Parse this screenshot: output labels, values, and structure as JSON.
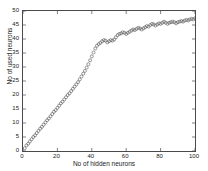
{
  "chart_data": {
    "type": "scatter",
    "title": "",
    "xlabel": "No of hidden neurons",
    "ylabel": "No of used neurons",
    "xlim": [
      0,
      100
    ],
    "ylim": [
      0,
      50
    ],
    "xticks": [
      0,
      20,
      40,
      60,
      80,
      100
    ],
    "yticks": [
      0,
      5,
      10,
      15,
      20,
      25,
      30,
      35,
      40,
      45,
      50
    ],
    "grid": false,
    "legend": null,
    "marker": "open-circle",
    "marker_color": "#555555",
    "series": [
      {
        "name": "used neurons",
        "x": [
          1,
          2,
          3,
          4,
          5,
          6,
          7,
          8,
          9,
          10,
          11,
          12,
          13,
          14,
          15,
          16,
          17,
          18,
          19,
          20,
          21,
          22,
          23,
          24,
          25,
          26,
          27,
          28,
          29,
          30,
          31,
          32,
          33,
          34,
          35,
          36,
          37,
          38,
          39,
          40,
          41,
          42,
          43,
          44,
          45,
          46,
          47,
          48,
          49,
          50,
          51,
          52,
          53,
          54,
          55,
          56,
          57,
          58,
          59,
          60,
          61,
          62,
          63,
          64,
          65,
          66,
          67,
          68,
          69,
          70,
          71,
          72,
          73,
          74,
          75,
          76,
          77,
          78,
          79,
          80,
          81,
          82,
          83,
          84,
          85,
          86,
          87,
          88,
          89,
          90,
          91,
          92,
          93,
          94,
          95,
          96,
          97,
          98,
          99,
          100
        ],
        "y": [
          1,
          2,
          2.6,
          3.4,
          4.2,
          5,
          5.6,
          6.4,
          7.2,
          8,
          8.6,
          9.4,
          10.2,
          11,
          11.6,
          12.4,
          13.2,
          14,
          14.6,
          15.4,
          16.2,
          17,
          17.6,
          18.4,
          19.2,
          20,
          20.6,
          21.4,
          22.2,
          23,
          23.8,
          24.6,
          25.6,
          26.6,
          27.6,
          28.6,
          29.8,
          31,
          32.4,
          33.8,
          35.2,
          36.6,
          37.6,
          38.2,
          38.6,
          39.2,
          39.6,
          39.4,
          38.8,
          39.2,
          39.6,
          39.4,
          39.8,
          40.6,
          41.4,
          41.8,
          42,
          42.4,
          42.2,
          41.8,
          42.2,
          42.6,
          43,
          43.4,
          43.2,
          43.6,
          44,
          43.8,
          43.4,
          43.8,
          44.2,
          44.6,
          44.4,
          45,
          45.4,
          45.2,
          44.8,
          45.2,
          45.6,
          45.4,
          45.8,
          46.2,
          45.8,
          45.4,
          45.8,
          46,
          46.2,
          46,
          45.6,
          46,
          46.2,
          46.4,
          46.2,
          46.6,
          46.8,
          46.6,
          47,
          47.2,
          47,
          47.4
        ]
      }
    ]
  },
  "axes": {
    "xtick_labels": [
      "0",
      "20",
      "40",
      "60",
      "80",
      "100"
    ],
    "ytick_labels": [
      "0",
      "5",
      "10",
      "15",
      "20",
      "25",
      "30",
      "35",
      "40",
      "45",
      "50"
    ]
  }
}
